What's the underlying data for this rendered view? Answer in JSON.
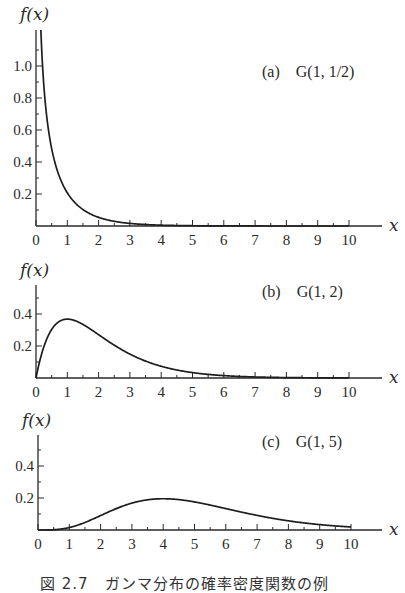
{
  "caption": "図 2.7　ガンマ分布の確率密度関数の例",
  "chart_data": [
    {
      "type": "line",
      "panel": "(a)",
      "title": "G(1, 1/2)",
      "distribution": {
        "family": "gamma",
        "rate": 1,
        "shape": 0.5
      },
      "xlabel": "x",
      "ylabel": "f(x)",
      "xlim": [
        0,
        10
      ],
      "ylim": [
        0,
        1.2
      ],
      "xticks": [
        0,
        1,
        2,
        3,
        4,
        5,
        6,
        7,
        8,
        9,
        10
      ],
      "xtick_labels": [
        "0",
        "1",
        "2",
        "3",
        "4",
        "5",
        "6",
        "7",
        "8",
        "9",
        "10"
      ],
      "yticks": [
        0.2,
        0.4,
        0.6,
        0.8,
        1.0
      ],
      "ytick_labels": [
        "0.2",
        "0.4",
        "0.6",
        "0.8",
        "1.0"
      ],
      "grid": false,
      "series": [
        {
          "name": "G(1, 1/2)",
          "x": [
            0.05,
            0.1,
            0.2,
            0.3,
            0.5,
            0.75,
            1,
            1.5,
            2,
            2.5,
            3,
            4,
            5,
            6,
            7,
            8,
            9,
            10
          ],
          "y": [
            2.4,
            1.61,
            1.03,
            0.77,
            0.48,
            0.31,
            0.21,
            0.1,
            0.052,
            0.029,
            0.016,
            0.005,
            0.002,
            0.001,
            0.0,
            0.0,
            0.0,
            0.0
          ]
        }
      ]
    },
    {
      "type": "line",
      "panel": "(b)",
      "title": "G(1, 2)",
      "distribution": {
        "family": "gamma",
        "rate": 1,
        "shape": 2
      },
      "xlabel": "x",
      "ylabel": "f(x)",
      "xlim": [
        0,
        10
      ],
      "ylim": [
        0,
        0.6
      ],
      "xticks": [
        0,
        1,
        2,
        3,
        4,
        5,
        6,
        7,
        8,
        9,
        10
      ],
      "xtick_labels": [
        "0",
        "1",
        "2",
        "3",
        "4",
        "5",
        "6",
        "7",
        "8",
        "9",
        "10"
      ],
      "yticks": [
        0.2,
        0.4
      ],
      "ytick_labels": [
        "0.2",
        "0.4"
      ],
      "grid": false,
      "series": [
        {
          "name": "G(1, 2)",
          "x": [
            0,
            0.25,
            0.5,
            1,
            1.5,
            2,
            2.5,
            3,
            4,
            5,
            6,
            7,
            8,
            9,
            10
          ],
          "y": [
            0,
            0.195,
            0.303,
            0.368,
            0.335,
            0.271,
            0.205,
            0.149,
            0.073,
            0.034,
            0.015,
            0.006,
            0.003,
            0.001,
            0.0
          ]
        }
      ]
    },
    {
      "type": "line",
      "panel": "(c)",
      "title": "G(1, 5)",
      "distribution": {
        "family": "gamma",
        "rate": 1,
        "shape": 5
      },
      "xlabel": "x",
      "ylabel": "f(x)",
      "xlim": [
        0,
        10
      ],
      "ylim": [
        0,
        0.6
      ],
      "xticks": [
        0,
        1,
        2,
        3,
        4,
        5,
        6,
        7,
        8,
        9,
        10
      ],
      "xtick_labels": [
        "0",
        "1",
        "2",
        "3",
        "4",
        "5",
        "6",
        "7",
        "8",
        "9",
        "10"
      ],
      "yticks": [
        0.2,
        0.4
      ],
      "ytick_labels": [
        "0.2",
        "0.4"
      ],
      "grid": false,
      "series": [
        {
          "name": "G(1, 5)",
          "x": [
            0,
            1,
            2,
            3,
            4,
            5,
            6,
            7,
            8,
            9,
            10
          ],
          "y": [
            0,
            0.015,
            0.09,
            0.168,
            0.195,
            0.175,
            0.134,
            0.091,
            0.057,
            0.034,
            0.019
          ]
        }
      ]
    }
  ]
}
